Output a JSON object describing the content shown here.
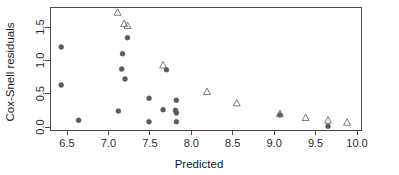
{
  "chart_data": {
    "type": "scatter",
    "title": "",
    "xlabel": "Predicted",
    "ylabel": "Cox-Snell residuals",
    "xlim": [
      6.3,
      10.05
    ],
    "ylim": [
      -0.05,
      1.82
    ],
    "grid": false,
    "legend_position": "none",
    "xticks": [
      6.5,
      7.0,
      7.5,
      8.0,
      8.5,
      9.0,
      9.5,
      10.0
    ],
    "xticklabels": [
      "6.5",
      "7.0",
      "7.5",
      "8.0",
      "8.5",
      "9.0",
      "9.5",
      "10.0"
    ],
    "yticks": [
      0.0,
      0.5,
      1.0,
      1.5
    ],
    "yticklabels": [
      "0.0",
      "0.5",
      "1.0",
      "1.5"
    ],
    "series": [
      {
        "name": "filled-circle",
        "marker": "circle",
        "color": "#5c5c5c",
        "points": [
          {
            "x": 6.43,
            "y": 1.2
          },
          {
            "x": 6.43,
            "y": 0.63
          },
          {
            "x": 6.64,
            "y": 0.1
          },
          {
            "x": 7.23,
            "y": 1.34
          },
          {
            "x": 7.17,
            "y": 1.1
          },
          {
            "x": 7.16,
            "y": 0.87
          },
          {
            "x": 7.2,
            "y": 0.72
          },
          {
            "x": 7.12,
            "y": 0.24
          },
          {
            "x": 7.49,
            "y": 0.43
          },
          {
            "x": 7.49,
            "y": 0.08
          },
          {
            "x": 7.66,
            "y": 0.26
          },
          {
            "x": 7.7,
            "y": 0.86
          },
          {
            "x": 7.82,
            "y": 0.4
          },
          {
            "x": 7.81,
            "y": 0.25
          },
          {
            "x": 7.82,
            "y": 0.21
          },
          {
            "x": 7.82,
            "y": 0.08
          },
          {
            "x": 9.07,
            "y": 0.18
          },
          {
            "x": 9.65,
            "y": 0.01
          }
        ]
      },
      {
        "name": "open-triangle",
        "marker": "triangle",
        "color": "#6b6b6b",
        "points": [
          {
            "x": 7.11,
            "y": 1.72
          },
          {
            "x": 7.19,
            "y": 1.55
          },
          {
            "x": 7.23,
            "y": 1.52
          },
          {
            "x": 7.66,
            "y": 0.93
          },
          {
            "x": 8.19,
            "y": 0.53
          },
          {
            "x": 8.55,
            "y": 0.36
          },
          {
            "x": 9.07,
            "y": 0.2
          },
          {
            "x": 9.38,
            "y": 0.14
          },
          {
            "x": 9.65,
            "y": 0.1
          },
          {
            "x": 9.88,
            "y": 0.07
          }
        ]
      }
    ]
  },
  "colors": {
    "axis": "#4a4a4a",
    "circle": "#5c5c5c",
    "triangle": "#6b6b6b",
    "background": "#ffffff"
  }
}
